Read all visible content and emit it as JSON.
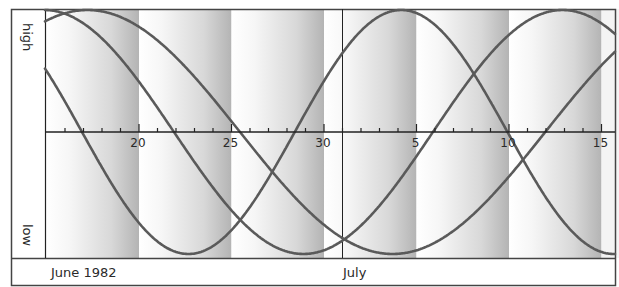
{
  "chart_data": {
    "type": "line",
    "title": "",
    "xlabel": "",
    "ylabel": "",
    "y_axis_labels": {
      "top": "high",
      "bottom": "low"
    },
    "month_labels": [
      {
        "label": "June 1982",
        "day_offset": 0
      },
      {
        "label": "July",
        "day_offset": 16
      }
    ],
    "x_range_days": {
      "start": "June 15 1982",
      "end": "July 15 1982",
      "min_offset": -0.08,
      "max_offset": 30.8
    },
    "tick_labels": [
      {
        "label": "20",
        "day_offset": 5
      },
      {
        "label": "25",
        "day_offset": 10
      },
      {
        "label": "30",
        "day_offset": 15
      },
      {
        "label": "5",
        "day_offset": 20
      },
      {
        "label": "10",
        "day_offset": 25
      },
      {
        "label": "15",
        "day_offset": 30
      }
    ],
    "minor_tick_every_days": 1,
    "month_boundary_day_offset": 16,
    "ylim": [
      -1,
      1
    ],
    "grid": false,
    "legend": null,
    "shaded_bands": {
      "width_days": 5,
      "gradient": "white to gray, darkest at right edge of each 5-day band"
    },
    "series": [
      {
        "name": "cycle-23-day",
        "period_days": 23,
        "descending_zero_crossing_day_offset": 1.92,
        "phase_note": "y = -sin(2π(t - 1.92)/23)"
      },
      {
        "name": "cycle-28-day",
        "period_days": 28,
        "descending_zero_crossing_day_offset": 6.89,
        "phase_note": "y = -sin(2π(t - 6.89)/28)"
      },
      {
        "name": "cycle-33-day",
        "period_days": 33,
        "descending_zero_crossing_day_offset": 10.46,
        "phase_note": "y = -sin(2π(t - 10.46)/33)"
      }
    ]
  },
  "layout": {
    "frame": {
      "x": 11,
      "y": 9,
      "w": 604,
      "h": 276
    },
    "plot": {
      "x0": 45,
      "x1": 615,
      "y_top": 9,
      "y_bottom": 258,
      "baseline": 132,
      "amplitude": 122
    },
    "day_zero_x": 46.5,
    "px_per_day": 18.5
  },
  "colors": {
    "curve": "#5a5a5a",
    "axis": "#222222",
    "band_light": "#ffffff",
    "band_dark": "#b8b8b8",
    "frame": "#444444"
  }
}
